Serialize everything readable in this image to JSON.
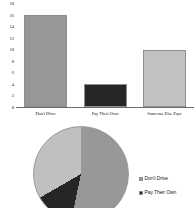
{
  "chart_data": [
    {
      "type": "bar",
      "title": "",
      "xlabel": "",
      "ylabel": "",
      "categories": [
        "Don't Drive",
        "Pay Their Own",
        "Someone Else Pays"
      ],
      "values": [
        16,
        4,
        10
      ],
      "ylim": [
        0,
        18
      ],
      "yticks": [
        "0",
        "2",
        "4",
        "6",
        "8",
        "10",
        "12",
        "14",
        "16",
        "18"
      ],
      "grid": false,
      "legend": "none",
      "colors": [
        "#979797",
        "#262626",
        "#c2c2c2"
      ]
    },
    {
      "type": "pie",
      "title": "",
      "labels": [
        "Don't Drive",
        "Pay Their Own",
        "Someone Else Pays"
      ],
      "values": [
        16,
        4,
        10
      ],
      "percentages": [
        53.3,
        13.3,
        33.3
      ],
      "colors": [
        "#989898",
        "#262626",
        "#c0c0c0"
      ],
      "legend": "right",
      "legend_entries": [
        "Don't Drive",
        "Pay Their Own"
      ],
      "note": "pie and third legend entry clipped by bottom edge of image"
    }
  ],
  "bar_chart": {
    "yticks": [
      {
        "label": "18",
        "value": 18
      },
      {
        "label": "16",
        "value": 16
      },
      {
        "label": "14",
        "value": 14
      },
      {
        "label": "12",
        "value": 12
      },
      {
        "label": "10",
        "value": 10
      },
      {
        "label": "8",
        "value": 8
      },
      {
        "label": "6",
        "value": 6
      },
      {
        "label": "4",
        "value": 4
      },
      {
        "label": "2",
        "value": 2
      },
      {
        "label": "0",
        "value": 0
      }
    ],
    "bars": [
      {
        "label": "Don't Drive",
        "value": 16,
        "color": "#979797"
      },
      {
        "label": "Pay Their Own",
        "value": 4,
        "color": "#262626"
      },
      {
        "label": "Someone Else Pays",
        "value": 10,
        "color": "#c2c2c2"
      }
    ],
    "ymax": 18
  },
  "pie_chart": {
    "slices": [
      {
        "label": "Don't Drive",
        "value": 16,
        "color": "#989898"
      },
      {
        "label": "Pay Their Own",
        "value": 4,
        "color": "#262626"
      },
      {
        "label": "Someone Else Pays",
        "value": 10,
        "color": "#c0c0c0"
      }
    ],
    "legend": [
      {
        "label": "Don't Drive",
        "color": "#989898"
      },
      {
        "label": "Pay Their Own",
        "color": "#262626"
      }
    ]
  }
}
